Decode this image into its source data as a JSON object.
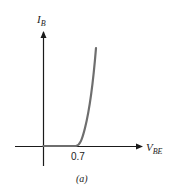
{
  "diagram": {
    "y_axis": {
      "symbol": "I",
      "subscript": "B"
    },
    "x_axis": {
      "symbol": "V",
      "subscript": "BE"
    },
    "knee_label": "0.7",
    "caption": "(a)",
    "colors": {
      "axis": "#1a1a1a",
      "curve": "#6e6e6e",
      "text": "#222222"
    }
  }
}
